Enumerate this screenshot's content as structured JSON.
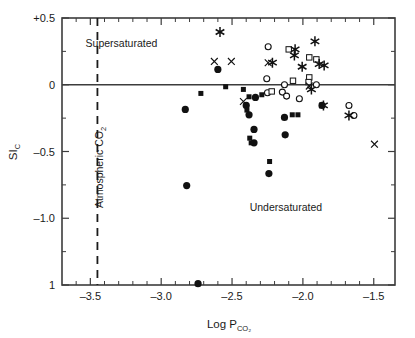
{
  "chart_data": {
    "type": "scatter",
    "title": "",
    "xlabel": "Log P",
    "xlabel_sub": "CO2",
    "ylabel": "SI",
    "ylabel_sub": "C",
    "xlim": [
      -3.7,
      -1.35
    ],
    "ylim": [
      -1.5,
      0.5
    ],
    "xticks": [
      -3.5,
      -3.0,
      -2.5,
      -2.0,
      -1.5
    ],
    "xticklabels": [
      "-3.5",
      "-3.0",
      "-2.5",
      "-2.0",
      "-1.5"
    ],
    "yticks": [
      0.5,
      0.0,
      -0.5,
      -1.0,
      -1.5
    ],
    "yticklabels": [
      "+0.5",
      "0",
      "-0.5",
      "-1.0",
      "1"
    ],
    "y_minor_ticks": [
      0.25,
      -0.25,
      -0.75,
      -1.25
    ],
    "grid": false,
    "legend_position": "none",
    "annotations": [
      {
        "name": "supersaturated-label",
        "text": "Supersaturated",
        "x": -3.28,
        "y": 0.285
      },
      {
        "name": "undersaturated-label",
        "text": "Undersaturated",
        "x": -2.12,
        "y": -0.945
      },
      {
        "name": "atmospheric-co2-label",
        "text": "Atmospheric CO",
        "text_sub": "2",
        "x": -3.41,
        "y": -0.62,
        "rotated": true
      }
    ],
    "reference_lines": [
      {
        "name": "zero-saturation-line",
        "orientation": "horizontal",
        "value": 0.0,
        "style": "solid"
      },
      {
        "name": "atmospheric-co2-line",
        "orientation": "vertical",
        "value": -3.45,
        "style": "dashed"
      }
    ],
    "series": [
      {
        "name": "filled-circle",
        "marker": "filled-circle",
        "points": [
          [
            -2.6,
            0.115
          ],
          [
            -2.83,
            -0.185
          ],
          [
            -2.4,
            -0.155
          ],
          [
            -2.38,
            -0.225
          ],
          [
            -2.345,
            -0.335
          ],
          [
            -2.345,
            -0.435
          ],
          [
            -2.335,
            -0.095
          ],
          [
            -2.24,
            -0.665
          ],
          [
            -2.13,
            -0.245
          ],
          [
            -2.125,
            -0.375
          ],
          [
            -2.82,
            -0.755
          ],
          [
            -1.865,
            -0.155
          ],
          [
            -2.74,
            -1.49
          ]
        ]
      },
      {
        "name": "filled-square",
        "marker": "filled-square",
        "points": [
          [
            -2.72,
            -0.065
          ],
          [
            -2.545,
            -0.015
          ],
          [
            -2.42,
            -0.035
          ],
          [
            -2.395,
            -0.19
          ],
          [
            -2.375,
            -0.4
          ],
          [
            -2.365,
            -0.435
          ],
          [
            -2.38,
            -0.09
          ],
          [
            -2.235,
            -0.575
          ],
          [
            -2.075,
            -0.225
          ],
          [
            -2.035,
            -0.225
          ],
          [
            -2.29,
            -0.075
          ]
        ]
      },
      {
        "name": "open-circle",
        "marker": "open-circle",
        "points": [
          [
            -2.245,
            0.285
          ],
          [
            -2.255,
            0.045
          ],
          [
            -2.25,
            -0.06
          ],
          [
            -2.145,
            -0.055
          ],
          [
            -2.13,
            0.0
          ],
          [
            -2.115,
            -0.085
          ],
          [
            -2.025,
            -0.105
          ],
          [
            -1.905,
            0.0
          ],
          [
            -1.64,
            -0.23
          ],
          [
            -1.675,
            -0.155
          ]
        ]
      },
      {
        "name": "open-square",
        "marker": "open-square",
        "points": [
          [
            -2.1,
            0.265
          ],
          [
            -1.955,
            0.205
          ],
          [
            -1.905,
            0.19
          ],
          [
            -2.07,
            0.03
          ],
          [
            -2.22,
            -0.05
          ],
          [
            -1.955,
            0.055
          ],
          [
            -1.96,
            0.02
          ]
        ]
      },
      {
        "name": "ex-marker",
        "marker": "ex",
        "points": [
          [
            -2.625,
            0.175
          ],
          [
            -2.505,
            0.175
          ],
          [
            -2.245,
            0.165
          ],
          [
            -1.955,
            -0.01
          ],
          [
            -2.42,
            -0.125
          ],
          [
            -1.495,
            -0.445
          ]
        ]
      },
      {
        "name": "asterisk",
        "marker": "asterisk",
        "points": [
          [
            -2.585,
            0.395
          ],
          [
            -1.915,
            0.325
          ],
          [
            -2.055,
            0.265
          ],
          [
            -2.06,
            0.22
          ],
          [
            -2.215,
            0.165
          ],
          [
            -2.005,
            0.135
          ],
          [
            -1.885,
            0.155
          ],
          [
            -1.85,
            0.145
          ],
          [
            -1.94,
            -0.035
          ],
          [
            -1.855,
            -0.155
          ],
          [
            -1.675,
            -0.23
          ]
        ]
      }
    ]
  }
}
